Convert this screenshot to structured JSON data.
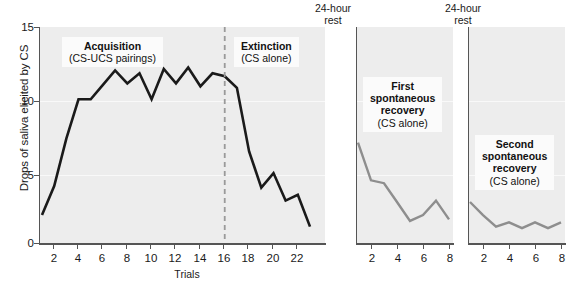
{
  "chart_data": {
    "type": "line",
    "title": "",
    "ylabel": "Drops of saliva elicited by CS",
    "ylim": [
      0,
      15
    ],
    "yticks": [
      0,
      5,
      10,
      15
    ],
    "grid": true,
    "legend": "none",
    "panels": [
      {
        "id": "acquisition-extinction",
        "xlabel": "Trials",
        "xticks": [
          2,
          4,
          6,
          8,
          10,
          12,
          14,
          16,
          18,
          20,
          22
        ],
        "xlim": [
          1,
          23
        ],
        "x": [
          1,
          2,
          3,
          4,
          5,
          6,
          7,
          8,
          9,
          10,
          11,
          12,
          13,
          14,
          15,
          16,
          17,
          18,
          19,
          20,
          21,
          22,
          23
        ],
        "values": [
          2.0,
          4.0,
          7.3,
          10.0,
          10.0,
          11.0,
          12.0,
          11.1,
          11.8,
          10.0,
          12.1,
          11.1,
          12.2,
          10.9,
          11.8,
          11.6,
          10.8,
          6.4,
          3.9,
          4.9,
          3.0,
          3.4,
          1.2
        ],
        "annotations": [
          {
            "id": "acquisition",
            "bold": "Acquisition",
            "normal": "(CS-UCS pairings)"
          },
          {
            "id": "extinction",
            "bold": "Extinction",
            "normal": "(CS alone)"
          }
        ],
        "divider_at_x": 16
      },
      {
        "id": "first-spontaneous-recovery",
        "xlabel": "",
        "xticks": [
          2,
          4,
          6,
          8
        ],
        "xlim": [
          1,
          8
        ],
        "x": [
          1,
          2,
          3,
          4,
          5,
          6,
          7,
          8
        ],
        "values": [
          7.0,
          4.4,
          4.2,
          2.9,
          1.6,
          2.0,
          3.0,
          1.7
        ],
        "annotations": [
          {
            "id": "first-recovery",
            "bold": "First spontaneous recovery",
            "normal": "(CS alone)"
          }
        ],
        "top_label": "24-hour rest"
      },
      {
        "id": "second-spontaneous-recovery",
        "xlabel": "",
        "xticks": [
          2,
          4,
          6,
          8
        ],
        "xlim": [
          1,
          8
        ],
        "x": [
          1,
          2,
          3,
          4,
          5,
          6,
          7,
          8
        ],
        "values": [
          2.9,
          2.0,
          1.2,
          1.5,
          1.1,
          1.5,
          1.1,
          1.5
        ],
        "annotations": [
          {
            "id": "second-recovery",
            "bold": "Second spontaneous recovery",
            "normal": "(CS alone)"
          }
        ],
        "top_label": "24-hour rest"
      }
    ]
  },
  "axis": {
    "y_label": "Drops of saliva elicited by CS",
    "y_ticks": [
      "15",
      "10",
      "5",
      "0"
    ],
    "x_title_main": "Trials",
    "x_ticks_main": [
      "2",
      "4",
      "6",
      "8",
      "10",
      "12",
      "14",
      "16",
      "18",
      "20",
      "22"
    ],
    "x_ticks_panel2": [
      "2",
      "4",
      "6",
      "8"
    ],
    "x_ticks_panel3": [
      "2",
      "4",
      "6",
      "8"
    ]
  },
  "annotations": {
    "acquisition_title": "Acquisition",
    "acquisition_sub": "(CS-UCS pairings)",
    "extinction_title": "Extinction",
    "extinction_sub": "(CS alone)",
    "first_recovery_line1": "First",
    "first_recovery_line2": "spontaneous",
    "first_recovery_line3": "recovery",
    "first_recovery_sub": "(CS alone)",
    "second_recovery_line1": "Second",
    "second_recovery_line2": "spontaneous",
    "second_recovery_line3": "recovery",
    "second_recovery_sub": "(CS alone)",
    "rest_label_1_line1": "24-hour",
    "rest_label_1_line2": "rest",
    "rest_label_2_line1": "24-hour",
    "rest_label_2_line2": "rest"
  },
  "colors": {
    "line_main": "#1a1a1a",
    "line_recovery": "#8e8e8e",
    "panel_bg": "#ededed",
    "divider": "#9a9a9a",
    "axis": "#555555"
  }
}
